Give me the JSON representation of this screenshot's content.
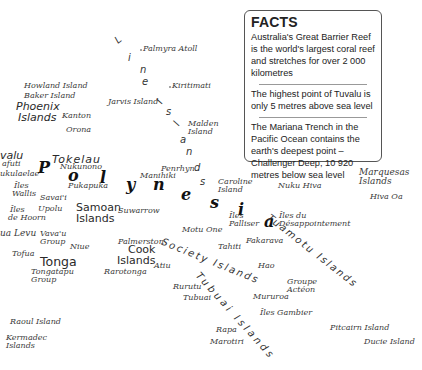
{
  "facts": {
    "title": "FACTS",
    "items": [
      "Australia's Great Barrier Reef is the world's largest coral reef and stretches for over 2 000 kilometres",
      "The highest point of Tuvalu is only 5 metres above sea level",
      "The Mariana Trench in the Pacific Ocean contains the earth's deepest point – Challenger Deep, 10 920 metres below sea level"
    ]
  },
  "region_label": {
    "letters": [
      "P",
      "o",
      "l",
      "y",
      "n",
      "e",
      "s",
      "i",
      "a"
    ]
  },
  "line_islands": {
    "letters": [
      "L",
      "i",
      "n",
      "e",
      "I",
      "s",
      "l",
      "a",
      "n",
      "d",
      "s"
    ]
  },
  "arc_labels": {
    "society": "Society Islands",
    "tuamotu": "Tuamotu Islands",
    "tubuai": "Tubuai Islands"
  },
  "groups": {
    "phoenix": [
      "Phoenix",
      "Islands"
    ],
    "tokelau": "Tokelau",
    "samoan": [
      "Samoan",
      "Islands"
    ],
    "tonga": "Tonga",
    "cook": [
      "Cook",
      "Islands"
    ],
    "marquesas": [
      "Marquesas",
      "Islands"
    ],
    "tuvalu_partial": "valu"
  },
  "places": {
    "palmyra": "Palmyra Atoll",
    "kiritimati": "Kiritimati",
    "howland": "Howland Island",
    "baker": "Baker Island",
    "jarvis": "Jarvis Island",
    "malden": [
      "Malden",
      "Island"
    ],
    "kanton": "Kanton",
    "orona": "Orona",
    "nukunono": "Nukunono",
    "funafuti_partial": "afuti",
    "nukulaelae_partial": "ukulaelae",
    "pukapuka": "Pukapuka",
    "manihiki": "Manihiki",
    "penrhyn": "Penrhyn",
    "caroline": [
      "Caroline",
      "Island"
    ],
    "nuku_hiva": "Nuku Hiva",
    "hiva_oa": "Hiva Oa",
    "iles_wallis": [
      "Îles",
      "Wallis"
    ],
    "savaii": "Savai'i",
    "upolu": "Upolu",
    "suwarrow": "Suwarrow",
    "iles_palliser": [
      "Îles",
      "Palliser"
    ],
    "iles_desappointement": [
      "Îles du",
      "Désappointement"
    ],
    "iles_de_hoorn": [
      "Îles",
      "de Hoorn"
    ],
    "vanua_levu_partial": "ua Levu",
    "vavau": [
      "Vava'u",
      "Group"
    ],
    "niue": "Niue",
    "palmerston": "Palmerston",
    "motu_one": "Motu One",
    "tahiti": "Tahiti",
    "fakarava": "Fakarava",
    "tofua": "Tofua",
    "tongatapu": [
      "Tongatapu",
      "Group"
    ],
    "rarotonga": "Rarotonga",
    "atiu": "Atiu",
    "hao": "Hao",
    "rurutu": "Rurutu",
    "tubuai": "Tubuai",
    "mururoa": "Mururoa",
    "groupe_acteon": [
      "Groupe",
      "Actéon"
    ],
    "iles_gambier": "Îles Gambier",
    "raoul": "Raoul Island",
    "kermadec": [
      "Kermadec",
      "Islands"
    ],
    "rapa": "Rapa",
    "marotiri": "Marotiri",
    "pitcairn": "Pitcairn Island",
    "ducie": "Ducie Island"
  }
}
